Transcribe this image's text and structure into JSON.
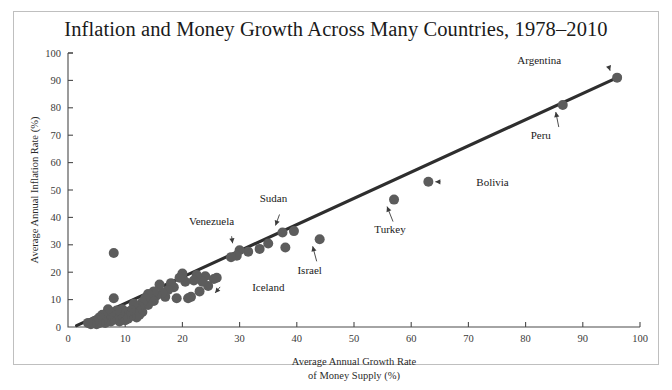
{
  "figure": {
    "title": "Inflation and Money Growth Across Many Countries, 1978–2010",
    "background_color": "#ffffff",
    "frame_color": "#bfbfbf",
    "marker_color": "#5c5c5c",
    "trendline_color": "#2e2e2e"
  },
  "chart_data": {
    "type": "scatter",
    "title": "Inflation and Money Growth Across Many Countries, 1978–2010",
    "xlabel": "Average Annual Growth Rate of Money Supply (%)",
    "xlabel_line1": "Average Annual Growth Rate",
    "xlabel_line2": "of Money Supply (%)",
    "ylabel": "Average Annual Inflation Rate (%)",
    "xlim": [
      0,
      100
    ],
    "ylim": [
      0,
      100
    ],
    "xticks": [
      0,
      10,
      20,
      30,
      40,
      50,
      60,
      70,
      80,
      90,
      100
    ],
    "yticks": [
      0,
      10,
      20,
      30,
      40,
      50,
      60,
      70,
      80,
      90,
      100
    ],
    "grid": false,
    "legend": "none",
    "trendline": {
      "label": "fitted line",
      "x": [
        1.5,
        96.5
      ],
      "y": [
        0.5,
        91.5
      ]
    },
    "annotations": [
      {
        "label": "Argentina",
        "x": 96.0,
        "y": 91.0,
        "label_side": "left"
      },
      {
        "label": "Peru",
        "x": 86.5,
        "y": 81.0,
        "label_side": "below-right"
      },
      {
        "label": "Bolivia",
        "x": 63.0,
        "y": 53.0,
        "label_side": "right"
      },
      {
        "label": "Turkey",
        "x": 57.0,
        "y": 46.5,
        "label_side": "below"
      },
      {
        "label": "Sudan",
        "x": 37.5,
        "y": 34.5,
        "label_side": "above"
      },
      {
        "label": "Venezuela",
        "x": 30.0,
        "y": 28.0,
        "label_side": "above-left"
      },
      {
        "label": "Israel",
        "x": 44.0,
        "y": 32.0,
        "label_side": "below"
      },
      {
        "label": "Iceland",
        "x": 24.5,
        "y": 15.0,
        "label_side": "right"
      }
    ],
    "points": [
      {
        "x": 96.0,
        "y": 91.0
      },
      {
        "x": 86.5,
        "y": 81.0
      },
      {
        "x": 63.0,
        "y": 53.0
      },
      {
        "x": 57.0,
        "y": 46.5
      },
      {
        "x": 44.0,
        "y": 32.0
      },
      {
        "x": 39.5,
        "y": 35.0
      },
      {
        "x": 37.5,
        "y": 34.5
      },
      {
        "x": 38.0,
        "y": 29.0
      },
      {
        "x": 35.0,
        "y": 30.5
      },
      {
        "x": 33.5,
        "y": 28.5
      },
      {
        "x": 31.5,
        "y": 27.5
      },
      {
        "x": 30.0,
        "y": 28.0
      },
      {
        "x": 29.5,
        "y": 26.0
      },
      {
        "x": 28.5,
        "y": 25.5
      },
      {
        "x": 26.0,
        "y": 18.0
      },
      {
        "x": 25.5,
        "y": 17.5
      },
      {
        "x": 24.5,
        "y": 15.0
      },
      {
        "x": 24.0,
        "y": 18.5
      },
      {
        "x": 23.5,
        "y": 16.5
      },
      {
        "x": 23.0,
        "y": 13.0
      },
      {
        "x": 22.5,
        "y": 19.0
      },
      {
        "x": 22.0,
        "y": 17.0
      },
      {
        "x": 21.5,
        "y": 11.0
      },
      {
        "x": 21.0,
        "y": 10.5
      },
      {
        "x": 20.5,
        "y": 16.5
      },
      {
        "x": 20.0,
        "y": 19.5
      },
      {
        "x": 19.5,
        "y": 18.0
      },
      {
        "x": 19.0,
        "y": 10.5
      },
      {
        "x": 18.5,
        "y": 14.5
      },
      {
        "x": 18.0,
        "y": 16.0
      },
      {
        "x": 17.5,
        "y": 13.5
      },
      {
        "x": 17.0,
        "y": 11.0
      },
      {
        "x": 16.5,
        "y": 12.5
      },
      {
        "x": 16.0,
        "y": 15.5
      },
      {
        "x": 15.5,
        "y": 11.5
      },
      {
        "x": 15.0,
        "y": 13.0
      },
      {
        "x": 15.0,
        "y": 9.5
      },
      {
        "x": 14.5,
        "y": 10.0
      },
      {
        "x": 14.0,
        "y": 12.0
      },
      {
        "x": 14.0,
        "y": 8.0
      },
      {
        "x": 13.5,
        "y": 10.5
      },
      {
        "x": 13.0,
        "y": 9.0
      },
      {
        "x": 13.0,
        "y": 5.5
      },
      {
        "x": 12.5,
        "y": 7.5
      },
      {
        "x": 12.5,
        "y": 4.5
      },
      {
        "x": 12.0,
        "y": 6.5
      },
      {
        "x": 12.0,
        "y": 3.5
      },
      {
        "x": 11.5,
        "y": 8.5
      },
      {
        "x": 11.5,
        "y": 5.0
      },
      {
        "x": 11.0,
        "y": 4.0
      },
      {
        "x": 11.0,
        "y": 6.0
      },
      {
        "x": 10.5,
        "y": 3.0
      },
      {
        "x": 10.5,
        "y": 5.5
      },
      {
        "x": 10.0,
        "y": 4.5
      },
      {
        "x": 10.0,
        "y": 2.5
      },
      {
        "x": 9.5,
        "y": 6.5
      },
      {
        "x": 9.5,
        "y": 3.5
      },
      {
        "x": 9.0,
        "y": 5.0
      },
      {
        "x": 9.0,
        "y": 2.0
      },
      {
        "x": 8.5,
        "y": 4.0
      },
      {
        "x": 8.5,
        "y": 6.0
      },
      {
        "x": 8.0,
        "y": 27.0
      },
      {
        "x": 8.0,
        "y": 10.5
      },
      {
        "x": 8.0,
        "y": 3.0
      },
      {
        "x": 7.5,
        "y": 5.0
      },
      {
        "x": 7.5,
        "y": 2.0
      },
      {
        "x": 7.0,
        "y": 4.0
      },
      {
        "x": 7.0,
        "y": 6.5
      },
      {
        "x": 6.5,
        "y": 3.0
      },
      {
        "x": 6.5,
        "y": 1.5
      },
      {
        "x": 6.0,
        "y": 4.5
      },
      {
        "x": 6.0,
        "y": 2.5
      },
      {
        "x": 5.5,
        "y": 3.5
      },
      {
        "x": 5.5,
        "y": 1.5
      },
      {
        "x": 5.0,
        "y": 2.5
      },
      {
        "x": 5.0,
        "y": 1.0
      },
      {
        "x": 4.5,
        "y": 2.0
      },
      {
        "x": 4.0,
        "y": 1.0
      },
      {
        "x": 3.5,
        "y": 1.5
      }
    ]
  }
}
